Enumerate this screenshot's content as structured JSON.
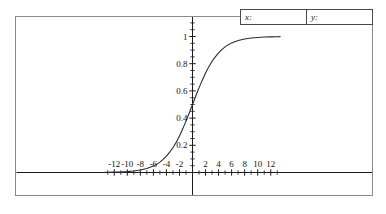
{
  "readout": {
    "x_label": "x:",
    "x_value": "",
    "y_label": "y:",
    "y_value": ""
  },
  "chart_data": {
    "type": "line",
    "title": "",
    "xlabel": "",
    "ylabel": "",
    "xlim": [
      -13.5,
      13.5
    ],
    "ylim": [
      -0.18,
      1.22
    ],
    "grid": false,
    "legend": "none",
    "x_ticks_labeled": [
      -12,
      -10,
      -8,
      -6,
      -4,
      -2,
      2,
      4,
      6,
      8,
      10,
      12
    ],
    "x_tick_labels": [
      "-12",
      "-10",
      "-8",
      "-6",
      "-4",
      "-2",
      "2",
      "4",
      "6",
      "8",
      "10",
      "12"
    ],
    "x_minor_tick_step": 1,
    "y_ticks_labeled": [
      0.2,
      0.4,
      0.6,
      0.8,
      1
    ],
    "y_tick_labels": [
      "0.2",
      "0.4",
      "0.6",
      "0.8",
      "1"
    ],
    "y_minor_tick_step": 0.05,
    "series": [
      {
        "name": "logistic",
        "color": "#2b2b2b",
        "asymptote_upper": 1,
        "asymptote_lower": 0,
        "y_intercept": 0.5,
        "x": [
          -13.5,
          -13,
          -12,
          -11,
          -10,
          -9,
          -8,
          -7,
          -6,
          -5.5,
          -5,
          -4.5,
          -4,
          -3.5,
          -3,
          -2.5,
          -2,
          -1.5,
          -1,
          -0.5,
          0,
          0.5,
          1,
          1.5,
          2,
          2.5,
          3,
          3.5,
          4,
          4.5,
          5,
          5.5,
          6,
          7,
          8,
          9,
          10,
          11,
          12,
          13,
          13.5
        ],
        "y": [
          0.0012,
          0.0015,
          0.0025,
          0.0041,
          0.0067,
          0.011,
          0.018,
          0.029,
          0.047,
          0.06,
          0.076,
          0.096,
          0.12,
          0.15,
          0.182,
          0.223,
          0.269,
          0.321,
          0.378,
          0.438,
          0.5,
          0.562,
          0.622,
          0.679,
          0.731,
          0.777,
          0.818,
          0.85,
          0.88,
          0.904,
          0.924,
          0.94,
          0.953,
          0.971,
          0.982,
          0.989,
          0.993,
          0.996,
          0.9975,
          0.9985,
          0.9988
        ]
      }
    ]
  },
  "colors": {
    "frame": "#8a8a8a",
    "axis": "#1c1c1c",
    "curve": "#2b2b2b",
    "text": "#141414",
    "readout_border": "#4a4a4a"
  }
}
